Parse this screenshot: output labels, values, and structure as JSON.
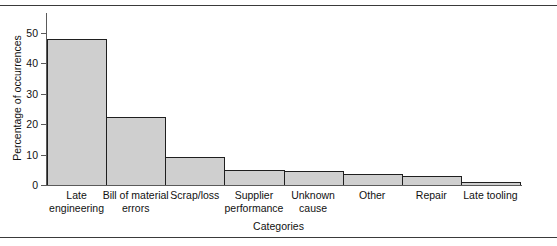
{
  "figure": {
    "background_color": "#ffffff",
    "rules": {
      "top_rule": "horizontal-rule",
      "bottom_rule": "horizontal-rule"
    }
  },
  "chart_data": {
    "type": "bar",
    "title": "",
    "subtitle": "",
    "xlabel": "Categories",
    "ylabel": "Percentage of occurrences",
    "categories": [
      "Late\nengineering",
      "Bill of material\nerrors",
      "Scrap/loss",
      "Supplier\nperformance",
      "Unknown\ncause",
      "Other",
      "Repair",
      "Late tooling"
    ],
    "values": [
      48,
      22.5,
      9.2,
      5,
      4.6,
      3.6,
      3,
      1
    ],
    "ylim": [
      0,
      52
    ],
    "yticks": [
      0,
      10,
      20,
      30,
      40,
      50
    ],
    "ytick_labels": [
      "0",
      "10",
      "20",
      "30",
      "40",
      "50"
    ],
    "grid": false,
    "legend": "none",
    "bar_fill_color": "#cfcfcf",
    "bar_edge_color": "#1f1f1f",
    "axis_color": "#5a5a5a",
    "bars_adjacent": true
  }
}
